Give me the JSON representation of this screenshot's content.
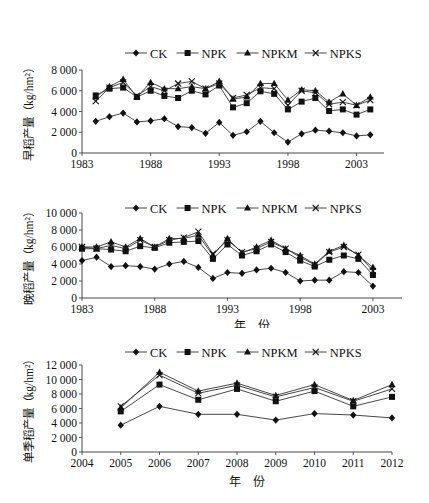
{
  "chart_data": [
    {
      "type": "line",
      "title": "",
      "xlabel": "年　份",
      "ylabel": "早稻产量（kg/hm²）",
      "ylim": [
        0,
        8000
      ],
      "yticks": [
        0,
        2000,
        4000,
        6000,
        8000
      ],
      "ytick_labels": [
        "0",
        "2 000",
        "4 000",
        "6 000",
        "8 000"
      ],
      "xlim": [
        1983,
        2005
      ],
      "xticks": [
        1983,
        1988,
        1993,
        1998,
        2003
      ],
      "grid": false,
      "legend_position": "top",
      "x": [
        1984,
        1985,
        1986,
        1987,
        1988,
        1989,
        1990,
        1991,
        1992,
        1993,
        1994,
        1995,
        1996,
        1997,
        1998,
        1999,
        2000,
        2001,
        2002,
        2003,
        2004
      ],
      "series": [
        {
          "name": "CK",
          "marker": "diamond",
          "values": [
            3050,
            3500,
            3850,
            3000,
            3100,
            3300,
            2550,
            2450,
            1900,
            2950,
            1700,
            2050,
            3050,
            1950,
            1050,
            1850,
            2200,
            2100,
            1950,
            1650,
            1750
          ]
        },
        {
          "name": "NPK",
          "marker": "square",
          "values": [
            5550,
            6200,
            6300,
            5400,
            6000,
            5500,
            5300,
            6000,
            5650,
            6500,
            4400,
            4800,
            5950,
            5700,
            4200,
            4950,
            5300,
            4050,
            4200,
            3700,
            4200
          ]
        },
        {
          "name": "NPKM",
          "marker": "triangle",
          "values": [
            5400,
            6400,
            7100,
            5400,
            6800,
            6200,
            6200,
            6400,
            6200,
            6900,
            5200,
            5400,
            6700,
            6700,
            5100,
            6100,
            6000,
            4900,
            5700,
            4600,
            5400
          ]
        },
        {
          "name": "NPKS",
          "marker": "x",
          "values": [
            5000,
            6300,
            6800,
            5500,
            6400,
            6000,
            6700,
            6900,
            6200,
            6700,
            5300,
            5600,
            6300,
            6200,
            4600,
            6000,
            5800,
            4700,
            4900,
            4600,
            5100
          ]
        }
      ]
    },
    {
      "type": "line",
      "title": "",
      "xlabel": "年　份",
      "ylabel": "晚稻产量（kg/hm²）",
      "ylim": [
        0,
        10000
      ],
      "yticks": [
        0,
        2000,
        4000,
        6000,
        8000,
        10000
      ],
      "ytick_labels": [
        "0",
        "2 000",
        "4 000",
        "6 000",
        "8 000",
        "10 000"
      ],
      "xlim": [
        1983,
        2005
      ],
      "xticks": [
        1983,
        1988,
        1993,
        1998,
        2003
      ],
      "grid": false,
      "legend_position": "top",
      "x": [
        1983,
        1984,
        1985,
        1986,
        1987,
        1988,
        1989,
        1990,
        1991,
        1992,
        1993,
        1994,
        1995,
        1996,
        1997,
        1998,
        1999,
        2000,
        2001,
        2002,
        2003
      ],
      "series": [
        {
          "name": "CK",
          "marker": "diamond",
          "values": [
            4400,
            4800,
            3700,
            3800,
            3700,
            3400,
            4000,
            4300,
            3600,
            2300,
            3000,
            2900,
            3300,
            3500,
            3000,
            2000,
            2100,
            2100,
            3100,
            3000,
            1400
          ]
        },
        {
          "name": "NPK",
          "marker": "square",
          "values": [
            5800,
            5800,
            5700,
            5500,
            6100,
            5900,
            6500,
            6600,
            6700,
            4600,
            6300,
            5000,
            5500,
            6300,
            5400,
            4400,
            3700,
            4500,
            5000,
            4600,
            2700
          ]
        },
        {
          "name": "NPKM",
          "marker": "triangle",
          "values": [
            6000,
            6000,
            6600,
            6000,
            7000,
            6000,
            7000,
            7000,
            7400,
            5000,
            7000,
            5300,
            6000,
            6800,
            5800,
            5000,
            4000,
            5500,
            6200,
            5000,
            3600
          ]
        },
        {
          "name": "NPKS",
          "marker": "x",
          "values": [
            6000,
            5800,
            6200,
            5800,
            6800,
            6000,
            6800,
            7100,
            7800,
            5200,
            6800,
            5400,
            5800,
            6600,
            5800,
            4800,
            3900,
            5400,
            6000,
            5100,
            3200
          ]
        }
      ]
    },
    {
      "type": "line",
      "title": "",
      "xlabel": "年　份",
      "ylabel": "单季稻产量（kg/hm²）",
      "ylim": [
        0,
        12000
      ],
      "yticks": [
        0,
        2000,
        4000,
        6000,
        8000,
        10000,
        12000
      ],
      "ytick_labels": [
        "0",
        "2 000",
        "4 000",
        "6 000",
        "8 000",
        "10 000",
        "12 000"
      ],
      "xlim": [
        2004,
        2012
      ],
      "xticks": [
        2004,
        2005,
        2006,
        2007,
        2008,
        2009,
        2010,
        2011,
        2012
      ],
      "grid": false,
      "legend_position": "top",
      "x": [
        2005,
        2006,
        2007,
        2008,
        2009,
        2010,
        2011,
        2012
      ],
      "series": [
        {
          "name": "CK",
          "marker": "diamond",
          "values": [
            3700,
            6300,
            5200,
            5200,
            4400,
            5300,
            5100,
            4700
          ]
        },
        {
          "name": "NPK",
          "marker": "square",
          "values": [
            5600,
            9300,
            7200,
            8700,
            7000,
            8400,
            6300,
            7600
          ]
        },
        {
          "name": "NPKM",
          "marker": "triangle",
          "values": [
            6100,
            11000,
            8400,
            9500,
            7800,
            9300,
            7100,
            9300
          ]
        },
        {
          "name": "NPKS",
          "marker": "x",
          "values": [
            6300,
            10600,
            8100,
            9200,
            7600,
            8900,
            7000,
            8700
          ]
        }
      ]
    }
  ],
  "layout": [
    {
      "top": 18,
      "height": 150,
      "plot": {
        "x0": 82,
        "x1": 384,
        "y0": 52,
        "y1": 135
      },
      "legend_y": 35,
      "xlabel_y": 162
    },
    {
      "top": 176,
      "height": 152,
      "plot": {
        "x0": 82,
        "x1": 402,
        "y0": 37,
        "y1": 122
      },
      "legend_y": 32,
      "xlabel_y": 154
    },
    {
      "top": 330,
      "height": 160,
      "plot": {
        "x0": 82,
        "x1": 392,
        "y0": 35,
        "y1": 122
      },
      "legend_y": 22,
      "xlabel_y": 156
    }
  ]
}
